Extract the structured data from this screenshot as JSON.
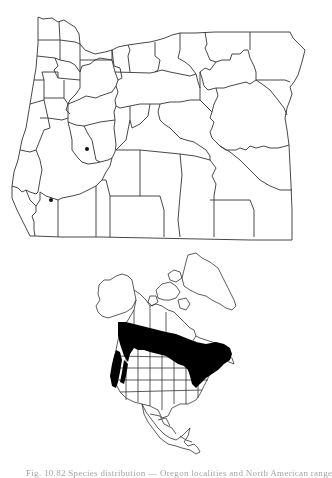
{
  "figure": {
    "oregon_map": {
      "label": "Oregon county map",
      "locality_dots": [
        {
          "x": 87,
          "y": 149
        },
        {
          "x": 51,
          "y": 200
        }
      ]
    },
    "north_america_map": {
      "label": "North America range map",
      "range_fill_color": "#000000"
    },
    "caption": "Fig. 10.82 Species distribution — Oregon localities and North American range"
  },
  "colors": {
    "line": "#333333",
    "background": "#ffffff",
    "fill": "#000000"
  }
}
